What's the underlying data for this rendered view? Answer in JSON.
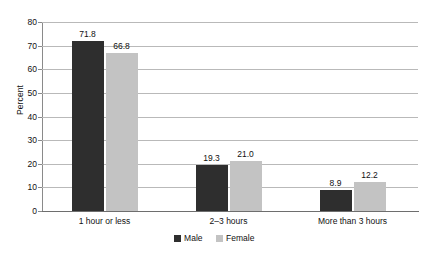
{
  "chart_data": {
    "type": "bar",
    "title": "",
    "subtitle": "",
    "xlabel": "",
    "ylabel": "Percent",
    "ylim": [
      0,
      80
    ],
    "yticks": [
      0,
      10,
      20,
      30,
      40,
      50,
      60,
      70,
      80
    ],
    "ytick_labels": [
      "0",
      "10",
      "20",
      "30",
      "40",
      "50",
      "60",
      "70",
      "80"
    ],
    "grid": "horizontal",
    "legend_position": "bottom-center",
    "categories": [
      "1 hour or less",
      "2–3 hours",
      "More than 3 hours"
    ],
    "series": [
      {
        "name": "Male",
        "color": "#2e2e2e",
        "values": [
          71.8,
          19.3,
          8.9
        ],
        "value_labels": [
          "71.8",
          "19.3",
          "8.9"
        ]
      },
      {
        "name": "Female",
        "color": "#c3c3c3",
        "values": [
          66.8,
          21.0,
          12.2
        ],
        "value_labels": [
          "66.8",
          "21.0",
          "12.2"
        ]
      }
    ]
  },
  "colors": {
    "male": "#2e2e2e",
    "female": "#c3c3c3",
    "gridline": "#b9b9b9",
    "axis": "#6e6e6e",
    "text": "#111111",
    "background": "#ffffff"
  }
}
